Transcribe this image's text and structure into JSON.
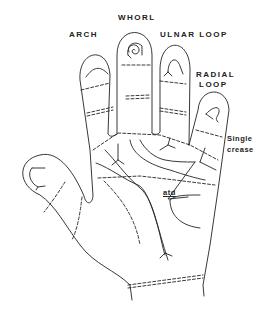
{
  "labels": {
    "whorl": "WHORL",
    "arch": "ARCH",
    "ulnar_loop": "ULNAR LOOP",
    "radial_loop_1": "RADIAL",
    "radial_loop_2": "LOOP",
    "single_crease_1": "Single",
    "single_crease_2": "crease",
    "atd": "atd"
  },
  "colors": {
    "line": "#222222",
    "background": "#ffffff"
  }
}
